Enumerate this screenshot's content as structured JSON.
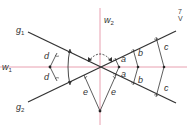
{
  "figure": {
    "colors": {
      "line": "#333333",
      "bisector": "#e8a0b0",
      "point": "#222222"
    },
    "labels": {
      "g1": "g",
      "g1_sub": "1",
      "g2": "g",
      "g2_sub": "2",
      "w1": "w",
      "w1_sub": "1",
      "w2": "w",
      "w2_sub": "2",
      "a": "a",
      "b": "b",
      "c": "c",
      "d": "d",
      "e": "e"
    },
    "corner_text": [
      "7",
      "V"
    ]
  }
}
